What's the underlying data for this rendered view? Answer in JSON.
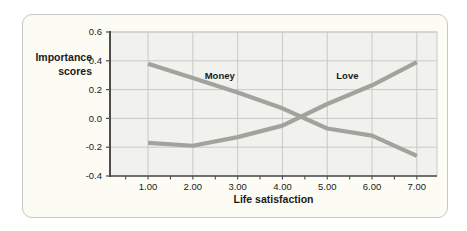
{
  "chart_data": {
    "type": "line",
    "xlabel": "Life satisfaction",
    "ylabel": "Importance scores",
    "ylabel_lines": [
      "Importance",
      "scores"
    ],
    "x": [
      1,
      2,
      3,
      4,
      5,
      6,
      7
    ],
    "x_tick_labels": [
      "1.00",
      "2.00",
      "3.00",
      "4.00",
      "5.00",
      "6.00",
      "7.00"
    ],
    "y_ticks": [
      0.6,
      0.4,
      0.2,
      0.0,
      -0.2,
      -0.4
    ],
    "y_tick_labels": [
      "0.6",
      "0.4",
      "0.2",
      "0.0",
      "-0.2",
      "-0.4"
    ],
    "xlim": [
      0.15,
      7.45
    ],
    "ylim": [
      -0.4,
      0.6
    ],
    "x_minor_tick_start": 0.5,
    "x_minor_tick_step": 0.5,
    "x_minor_tick_end": 7.0,
    "grid": true,
    "legend_position": "inline-labels",
    "series": [
      {
        "name": "Money",
        "values": [
          0.38,
          0.28,
          0.18,
          0.07,
          -0.07,
          -0.12,
          -0.26
        ],
        "label_at": [
          2.6,
          0.3
        ]
      },
      {
        "name": "Love",
        "values": [
          -0.17,
          -0.19,
          -0.13,
          -0.05,
          0.1,
          0.23,
          0.39
        ],
        "label_at": [
          5.45,
          0.3
        ]
      }
    ],
    "colors": {
      "line": "#a3a39e",
      "plot_bg": "#f1f1ed",
      "grid": "#c9c9c5",
      "spine": "#4d4d4d",
      "text": "#1a1a1a",
      "card_bg": "#fcfcf5",
      "card_border": "#c6c6c4"
    }
  }
}
